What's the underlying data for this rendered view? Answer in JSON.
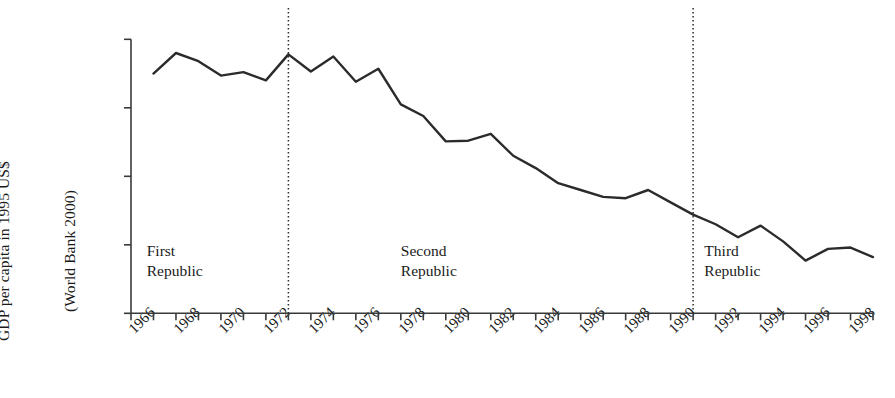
{
  "chart_data": {
    "type": "line",
    "title": "",
    "xlabel": "",
    "ylabel": "GDP per capita in 1995 US$ (World Bank 2000)",
    "ylabel_line1": "GDP per capita in 1995 US$",
    "ylabel_line2": "(World Bank 2000)",
    "ylim": [
      300,
      700
    ],
    "xlim": [
      1966,
      1999
    ],
    "grid": false,
    "legend": "none",
    "y_ticks": [
      300,
      400,
      500,
      600,
      700
    ],
    "y_tick_labels": [
      "$300",
      "$400",
      "$500",
      "$600",
      "$700"
    ],
    "x_ticks": [
      1966,
      1967,
      1968,
      1969,
      1970,
      1971,
      1972,
      1973,
      1974,
      1975,
      1976,
      1977,
      1978,
      1979,
      1980,
      1981,
      1982,
      1983,
      1984,
      1985,
      1986,
      1987,
      1988,
      1989,
      1990,
      1991,
      1992,
      1993,
      1994,
      1995,
      1996,
      1997,
      1998,
      1999
    ],
    "x_tick_labels": [
      "1966",
      "1968",
      "1970",
      "1972",
      "1974",
      "1976",
      "1978",
      "1980",
      "1982",
      "1984",
      "1986",
      "1988",
      "1990",
      "1992",
      "1994",
      "1996",
      "1998"
    ],
    "x_tick_label_years": [
      1966,
      1968,
      1970,
      1972,
      1974,
      1976,
      1978,
      1980,
      1982,
      1984,
      1986,
      1988,
      1990,
      1992,
      1994,
      1996,
      1998
    ],
    "series": [
      {
        "name": "GDP per capita",
        "color": "#2b2b2b",
        "x": [
          1967,
          1968,
          1969,
          1970,
          1971,
          1972,
          1973,
          1974,
          1975,
          1976,
          1977,
          1978,
          1979,
          1980,
          1981,
          1982,
          1983,
          1984,
          1985,
          1986,
          1987,
          1988,
          1989,
          1990,
          1991,
          1992,
          1993,
          1994,
          1995,
          1996,
          1997,
          1998,
          1999
        ],
        "values": [
          650,
          680,
          668,
          647,
          652,
          640,
          678,
          653,
          675,
          638,
          657,
          605,
          588,
          551,
          552,
          562,
          530,
          512,
          490,
          480,
          470,
          468,
          480,
          462,
          444,
          430,
          411,
          428,
          405,
          377,
          394,
          396,
          382
        ]
      }
    ],
    "annotations": [
      {
        "name": "first-republic",
        "line1": "First",
        "line2": "Republic",
        "x": 1966.7,
        "y": 388
      },
      {
        "name": "second-republic",
        "line1": "Second",
        "line2": "Republic",
        "x": 1978.0,
        "y": 388
      },
      {
        "name": "third-republic",
        "line1": "Third",
        "line2": "Republic",
        "x": 1991.5,
        "y": 388
      }
    ],
    "vertical_divider_lines": [
      {
        "name": "divider-1973",
        "x": 1973,
        "style": "dotted"
      },
      {
        "name": "divider-1991",
        "x": 1991,
        "style": "dotted"
      }
    ]
  }
}
